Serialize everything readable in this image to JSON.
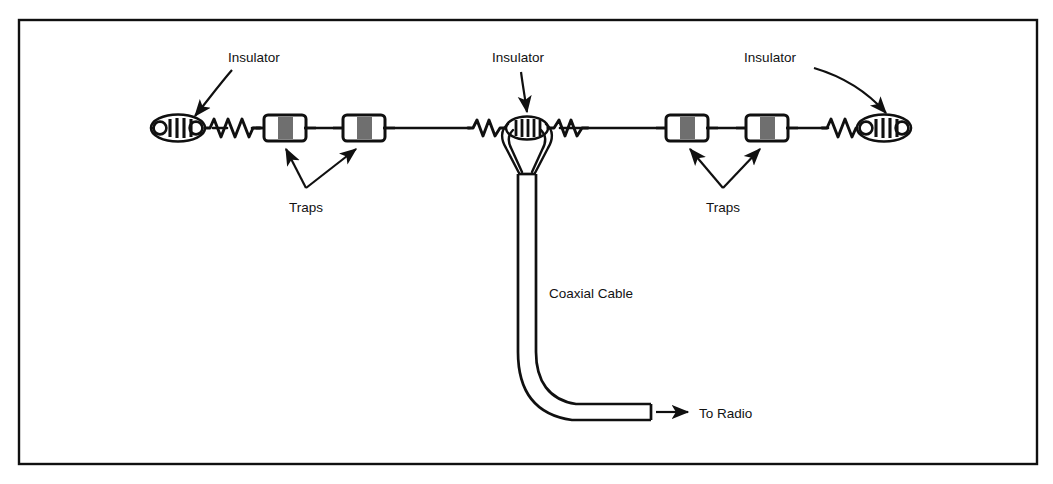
{
  "figure": {
    "border_color": "#101010",
    "line_color": "#101010",
    "trap_band_color": "#6f6f6f",
    "background": "#ffffff"
  },
  "labels": {
    "insulator_left": "Insulator",
    "insulator_center": "Insulator",
    "insulator_right": "Insulator",
    "traps_left": "Traps",
    "traps_right": "Traps",
    "coaxial_cable": "Coaxial Cable",
    "to_radio": "To Radio"
  },
  "components": {
    "insulators": [
      {
        "name": "left-end-insulator",
        "ribs": 5
      },
      {
        "name": "center-insulator",
        "ribs": 5
      },
      {
        "name": "right-end-insulator",
        "ribs": 5
      }
    ],
    "traps": [
      {
        "name": "trap-1"
      },
      {
        "name": "trap-2"
      },
      {
        "name": "trap-3"
      },
      {
        "name": "trap-4"
      }
    ],
    "coils": [
      {
        "name": "coil-left-end"
      },
      {
        "name": "coil-center-left"
      },
      {
        "name": "coil-center-right"
      },
      {
        "name": "coil-right-end"
      }
    ],
    "feedline": {
      "name": "coaxial-cable",
      "terminates_at": "To Radio"
    }
  }
}
